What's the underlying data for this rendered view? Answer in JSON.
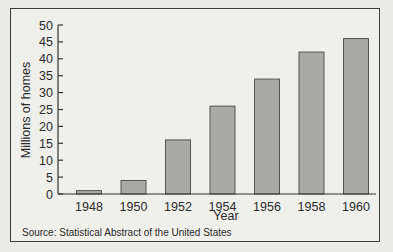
{
  "chart_data": {
    "type": "bar",
    "title": "",
    "xlabel": "Year",
    "ylabel": "Millions of homes",
    "categories": [
      "1948",
      "1950",
      "1952",
      "1954",
      "1956",
      "1958",
      "1960"
    ],
    "values": [
      1,
      4,
      16,
      26,
      34,
      42,
      46
    ],
    "ylim": [
      0,
      50
    ],
    "yticks": [
      0,
      5,
      10,
      15,
      20,
      25,
      30,
      35,
      40,
      45,
      50
    ],
    "grid": false,
    "legend": null,
    "bar_color": "#a9a9a6",
    "bar_edge_color": "#555555",
    "source": "Source: Statistical Abstract of the United States"
  }
}
